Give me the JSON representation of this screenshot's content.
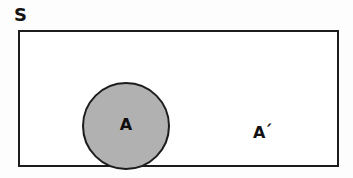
{
  "diagram": {
    "type": "venn-diagram",
    "background_color": "#fdfdfd",
    "universal_set": {
      "label": "S",
      "fill_color": "#ffffff",
      "stroke_color": "#1c1c1c"
    },
    "set_a": {
      "label": "A",
      "fill_color": "#b1b1b1",
      "stroke_color": "#1c1c1c"
    },
    "complement": {
      "label": "A",
      "prime_mark": "′",
      "fill_color": "#ffffff"
    }
  }
}
